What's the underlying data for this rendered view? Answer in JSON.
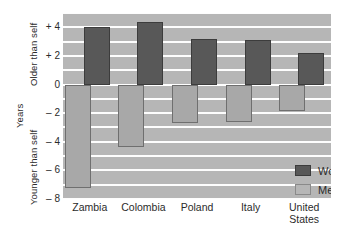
{
  "chart_data": {
    "type": "bar",
    "title": "",
    "xlabel": "",
    "ylabel": "Years",
    "ylim": [
      -8,
      5
    ],
    "yticks": [
      4,
      2,
      0,
      -2,
      -4,
      -6,
      -8
    ],
    "ytick_labels": [
      "+ 4",
      "+ 2",
      "0",
      "– 2",
      "– 4",
      "– 6",
      "– 8"
    ],
    "grid": true,
    "grid_step": 1,
    "axis_titles": {
      "units": "Years",
      "positive_direction": "Older than self",
      "negative_direction": "Younger than self"
    },
    "categories": [
      "Zambia",
      "Colombia",
      "Poland",
      "Italy",
      "United States"
    ],
    "category_lines": [
      [
        "Zambia"
      ],
      [
        "Colombia"
      ],
      [
        "Poland"
      ],
      [
        "Italy"
      ],
      [
        "United",
        "States"
      ]
    ],
    "series": [
      {
        "name": "Women",
        "color": "#585858",
        "values": [
          4.0,
          4.4,
          3.2,
          3.1,
          2.2
        ]
      },
      {
        "name": "Men",
        "color": "#b6b6b6",
        "values": [
          -7.2,
          -4.4,
          -2.7,
          -2.6,
          -1.85
        ]
      }
    ],
    "legend": {
      "position": "inside-bottom-right",
      "entries": [
        {
          "label": "Women",
          "swatch": "women"
        },
        {
          "label": "Men",
          "swatch": "men"
        }
      ]
    },
    "colors": {
      "plot_background": "#b6b6b6",
      "gridline": "#fdfdfd",
      "women_bar": "#585858",
      "men_bar": "#a8a8a8",
      "text": "#2b2b2b",
      "page_background": "#ffffff"
    }
  }
}
